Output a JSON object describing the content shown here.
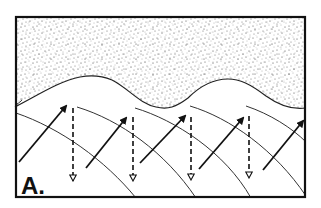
{
  "figure": {
    "panel_label": "A.",
    "colors": {
      "ink": "#111111",
      "background": "#ffffff",
      "stipple": "#555555"
    },
    "frame": {
      "x": 15,
      "y": 16,
      "width": 291,
      "height": 182
    },
    "stippled_region": "upper medium above wavy boundary",
    "solid_arrows_count": 5,
    "dashed_arrows_count": 4,
    "wavefront_lines_count": 5
  }
}
